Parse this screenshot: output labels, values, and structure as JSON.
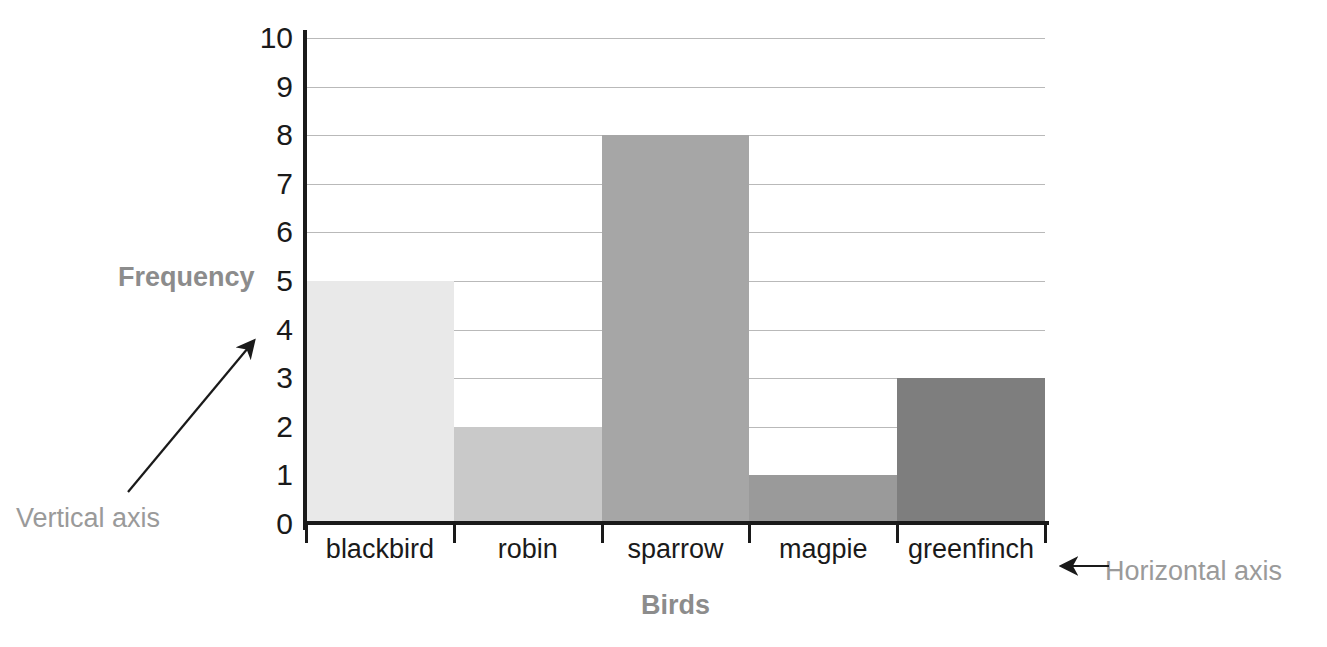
{
  "chart_data": {
    "type": "bar",
    "title": "",
    "subtitle": "",
    "categories": [
      "blackbird",
      "robin",
      "sparrow",
      "magpie",
      "greenfinch"
    ],
    "values": [
      5,
      2,
      8,
      1,
      3
    ],
    "xlabel": "Birds",
    "ylabel": "Frequency",
    "ylim": [
      0,
      10
    ],
    "ytick_labels": [
      "10",
      "9",
      "8",
      "7",
      "6",
      "5",
      "4",
      "3",
      "2",
      "1",
      "0"
    ],
    "ytick_values": [
      10,
      9,
      8,
      7,
      6,
      5,
      4,
      3,
      2,
      1,
      0
    ],
    "grid": "horizontal",
    "legend": "none",
    "bar_colors": [
      "#e9e9e9",
      "#c9c9c9",
      "#a6a6a6",
      "#9a9a9a",
      "#7e7e7e"
    ],
    "bar_gap": 0,
    "annotations": [
      {
        "text": "Vertical axis",
        "points_to": "y-axis"
      },
      {
        "text": "Horizontal axis",
        "points_to": "x-axis"
      }
    ]
  },
  "colors": {
    "axis": "#1a1a1a",
    "gridline": "#b9b9b9",
    "axis_title": "#8c8c8c",
    "annotation": "#9a9a9a",
    "tick_label": "#1a1a1a",
    "background": "#ffffff"
  },
  "annotations": {
    "vertical_axis_label": "Vertical axis",
    "horizontal_axis_label": "Horizontal axis"
  }
}
